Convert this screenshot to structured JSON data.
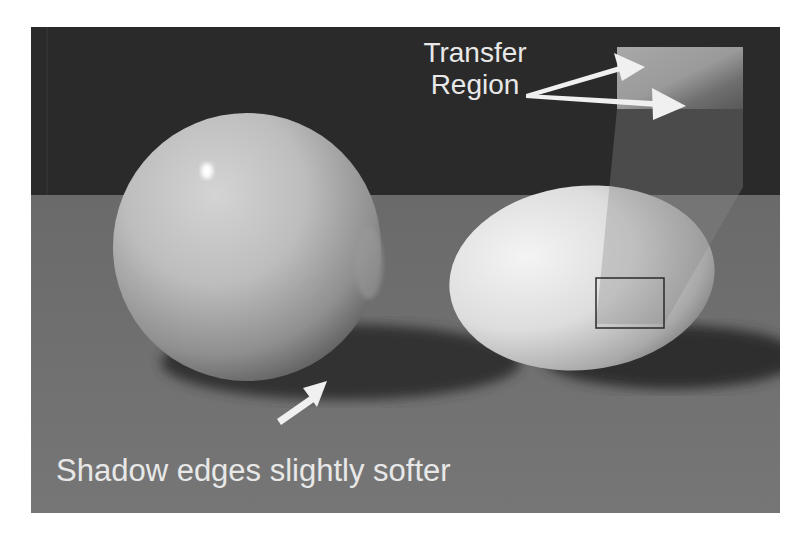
{
  "figure": {
    "annotations": {
      "transfer_region_line1": "Transfer",
      "transfer_region_line2": "Region",
      "shadow_caption": "Shadow edges slightly softer"
    },
    "colors": {
      "background_wall": "#2a2a2a",
      "floor": "#6e6e6e",
      "shadow": "#333333",
      "sphere_light": "#cfcfcf",
      "egg_light": "#ededed",
      "annotation_text": "#e8e8e8",
      "selection_box_stroke": "#2a2a2a"
    },
    "scene_objects": [
      "glossy sphere",
      "egg",
      "transfer region inset",
      "selection box on egg"
    ]
  }
}
